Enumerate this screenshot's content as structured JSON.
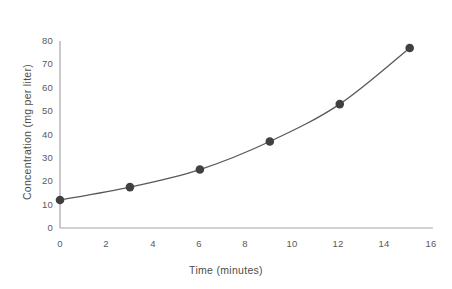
{
  "chart_data": {
    "type": "line",
    "title": "",
    "xlabel": "Time (minutes)",
    "ylabel": "Concentration (mg per  liter)",
    "x": [
      0,
      3,
      6,
      9,
      12,
      15
    ],
    "values": [
      12,
      17.5,
      25,
      37,
      53,
      77
    ],
    "series": [
      {
        "name": "Concentration",
        "x": [
          0,
          3,
          6,
          9,
          12,
          15
        ],
        "values": [
          12,
          17.5,
          25,
          37,
          53,
          77
        ]
      }
    ],
    "xlim": [
      0,
      16
    ],
    "ylim": [
      0,
      80
    ],
    "xticks": [
      "0",
      "2",
      "4",
      "6",
      "8",
      "10",
      "12",
      "14",
      "16"
    ],
    "xtick_values": [
      0,
      2,
      4,
      6,
      8,
      10,
      12,
      14,
      16
    ],
    "yticks": [
      "0",
      "10",
      "20",
      "30",
      "40",
      "50",
      "60",
      "70",
      "80"
    ],
    "ytick_values": [
      0,
      10,
      20,
      30,
      40,
      50,
      60,
      70,
      80
    ],
    "grid": false,
    "legend": "none",
    "marker": "circle",
    "line_color": "#595959",
    "marker_color": "#404040",
    "axis_color": "#a6a6a6",
    "text_color": "#595959",
    "background": "#ffffff"
  },
  "axes": {
    "y": {
      "ticks": [
        {
          "label": "80"
        },
        {
          "label": "70"
        },
        {
          "label": "60"
        },
        {
          "label": "50"
        },
        {
          "label": "40"
        },
        {
          "label": "30"
        },
        {
          "label": "20"
        },
        {
          "label": "10"
        },
        {
          "label": "0"
        }
      ],
      "title": "Concentration (mg per  liter)"
    },
    "x": {
      "ticks": [
        {
          "label": "0"
        },
        {
          "label": "2"
        },
        {
          "label": "4"
        },
        {
          "label": "6"
        },
        {
          "label": "8"
        },
        {
          "label": "10"
        },
        {
          "label": "12"
        },
        {
          "label": "14"
        },
        {
          "label": "16"
        }
      ],
      "title": "Time (minutes)"
    }
  }
}
